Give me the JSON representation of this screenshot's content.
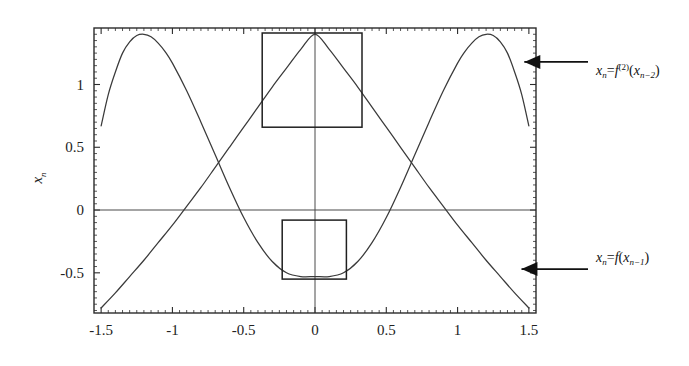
{
  "chart_data": {
    "type": "line",
    "title": "",
    "xlabel": "",
    "ylabel": "x_n",
    "xlim": [
      -1.55,
      1.55
    ],
    "ylim": [
      -0.82,
      1.45
    ],
    "grid": false,
    "legend_position": "inline-annotations-right",
    "x_ticks": [
      "-1.5",
      "-1",
      "-0.5",
      "0",
      "0.5",
      "1",
      "1.5"
    ],
    "x_tick_values": [
      -1.5,
      -1,
      -0.5,
      0,
      0.5,
      1,
      1.5
    ],
    "y_ticks": [
      "1",
      "0.5",
      "0",
      "-0.5"
    ],
    "y_tick_values": [
      1,
      0.5,
      0,
      -0.5
    ],
    "minor_ticks": true,
    "zero_lines": {
      "horizontal_y": 0,
      "vertical_x": 0
    },
    "series": [
      {
        "name": "x_n = f(x_{n-1})",
        "label_plain": "xn = f(xn-1)",
        "color": "#3a3a3a",
        "description": "single-hump curve, maximum at x=0",
        "x": [
          -1.5,
          -1.4,
          -1.3,
          -1.2,
          -1.1,
          -1.0,
          -0.9,
          -0.8,
          -0.7,
          -0.6,
          -0.5,
          -0.4,
          -0.3,
          -0.2,
          -0.1,
          0.0,
          0.1,
          0.2,
          0.3,
          0.4,
          0.5,
          0.6,
          0.7,
          0.8,
          0.9,
          1.0,
          1.1,
          1.2,
          1.3,
          1.4,
          1.5
        ],
        "y": [
          -0.78,
          -0.66,
          -0.53,
          -0.4,
          -0.26,
          -0.12,
          0.03,
          0.18,
          0.34,
          0.5,
          0.66,
          0.82,
          0.98,
          1.13,
          1.28,
          1.4,
          1.28,
          1.13,
          0.98,
          0.82,
          0.66,
          0.5,
          0.34,
          0.18,
          0.03,
          -0.12,
          -0.26,
          -0.4,
          -0.53,
          -0.66,
          -0.78
        ]
      },
      {
        "name": "x_n = f^(2)(x_{n-2})",
        "label_plain": "xn = f(2)(xn-2)",
        "color": "#3a3a3a",
        "description": "double-hump (W) curve, minimum at x=0, peaks near x = ±1.2",
        "x": [
          -1.5,
          -1.45,
          -1.4,
          -1.35,
          -1.3,
          -1.25,
          -1.2,
          -1.15,
          -1.1,
          -1.05,
          -1.0,
          -0.9,
          -0.8,
          -0.7,
          -0.6,
          -0.5,
          -0.4,
          -0.3,
          -0.2,
          -0.1,
          0.0,
          0.1,
          0.2,
          0.3,
          0.4,
          0.5,
          0.6,
          0.7,
          0.8,
          0.9,
          1.0,
          1.05,
          1.1,
          1.15,
          1.2,
          1.25,
          1.3,
          1.35,
          1.4,
          1.45,
          1.5
        ],
        "y": [
          0.67,
          0.92,
          1.1,
          1.25,
          1.34,
          1.39,
          1.4,
          1.38,
          1.33,
          1.26,
          1.17,
          0.95,
          0.7,
          0.44,
          0.18,
          -0.06,
          -0.26,
          -0.41,
          -0.5,
          -0.53,
          -0.53,
          -0.53,
          -0.5,
          -0.41,
          -0.26,
          -0.06,
          0.18,
          0.44,
          0.7,
          0.95,
          1.17,
          1.26,
          1.33,
          1.38,
          1.4,
          1.39,
          1.34,
          1.25,
          1.1,
          0.92,
          0.67
        ]
      }
    ],
    "annotations": [
      {
        "id": "upper-box",
        "type": "rectangle",
        "x0": -0.37,
        "x1": 0.33,
        "y0": 0.66,
        "y1": 1.41,
        "label": ""
      },
      {
        "id": "lower-box",
        "type": "rectangle",
        "x0": -0.23,
        "x1": 0.22,
        "y0": -0.55,
        "y1": -0.08,
        "label": ""
      },
      {
        "id": "upper-arrow-label",
        "type": "arrow-label",
        "target_x": 1.44,
        "target_y": 1.18,
        "text": "x_n = f^(2)(x_{n-2})"
      },
      {
        "id": "lower-arrow-label",
        "type": "arrow-label",
        "target_x": 1.42,
        "target_y": -0.47,
        "text": "x_n = f(x_{n-1})"
      }
    ]
  },
  "axes": {
    "y_title": "x",
    "y_title_sub": "n",
    "x_tick_labels": [
      "-1.5",
      "-1",
      "-0.5",
      "0",
      "0.5",
      "1",
      "1.5"
    ],
    "y_tick_labels": [
      "1",
      "0.5",
      "0",
      "-0.5"
    ]
  },
  "labels": {
    "upper": {
      "var": "x",
      "var_sub": "n",
      "eq": "=",
      "fn": "f",
      "fn_sup": "(2)",
      "open": "(",
      "arg": "x",
      "arg_sub": "n−2",
      "close": ")"
    },
    "lower": {
      "var": "x",
      "var_sub": "n",
      "eq": "=",
      "fn": "f",
      "fn_sup": "",
      "open": "(",
      "arg": "x",
      "arg_sub": "n−1",
      "close": ")"
    }
  },
  "colors": {
    "curve": "#3a3a3a",
    "frame": "#2b2b2b",
    "box": "#1f1f1f",
    "zero_line": "#4a4a4a",
    "arrow": "#111111",
    "background": "#ffffff"
  }
}
